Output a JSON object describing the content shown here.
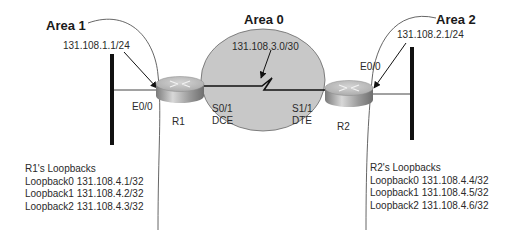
{
  "areas": [
    {
      "id": "area1",
      "label": "Area 1"
    },
    {
      "id": "area0",
      "label": "Area 0"
    },
    {
      "id": "area2",
      "label": "Area 2"
    }
  ],
  "routers": [
    {
      "id": "R1",
      "label": "R1"
    },
    {
      "id": "R2",
      "label": "R2"
    }
  ],
  "networks": {
    "lan1": "131.108.1.1/24",
    "serial": "131.108.3.0/30",
    "lan2": "131.108.2.1/24"
  },
  "interfaces": {
    "r1_e0": "E0/0",
    "r1_s0": "S0/1",
    "r1_s0_role": "DCE",
    "r2_s1": "S1/1",
    "r2_s1_role": "DTE",
    "r2_e0": "E0/0"
  },
  "loopbacks": {
    "r1": {
      "title": "R1's Loopbacks",
      "items": [
        "Loopback0 131.108.4.1/32",
        "Loopback1 131.108.4.2/32",
        "Loopback2 131.108.4.3/32"
      ]
    },
    "r2": {
      "title": "R2's Loopbacks",
      "items": [
        "Loopback0 131.108.4.4/32",
        "Loopback1 131.108.4.5/32",
        "Loopback2 131.108.4.6/32"
      ]
    }
  },
  "colors": {
    "area0_fill": "#c8c8c8",
    "line": "#333333",
    "bus": "#111111",
    "router_top": "#b9b9b9",
    "router_side": "#8a8a8a"
  }
}
